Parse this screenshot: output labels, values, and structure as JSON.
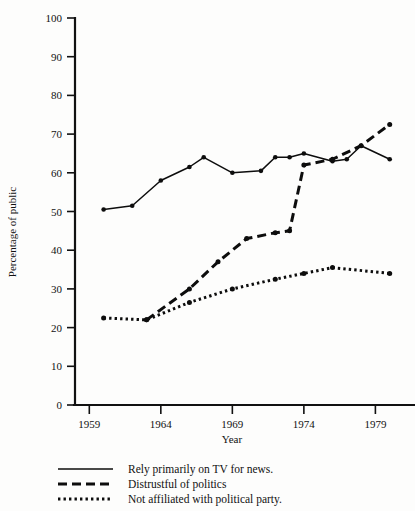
{
  "chart_data": {
    "type": "line",
    "title": "",
    "xlabel": "Year",
    "ylabel": "Percentage of public",
    "xlim": [
      1958,
      1981
    ],
    "ylim": [
      0,
      100
    ],
    "grid": false,
    "legend_position": "below",
    "xticks": [
      1959,
      1964,
      1969,
      1974,
      1979
    ],
    "xtick_labels": [
      "1959",
      "1964",
      "1969",
      "1974",
      "1979"
    ],
    "yticks": [
      0,
      10,
      20,
      30,
      40,
      50,
      60,
      70,
      80,
      90,
      100
    ],
    "ytick_labels": [
      "0",
      "10",
      "20",
      "30",
      "40",
      "50",
      "60",
      "70",
      "80",
      "90",
      "100"
    ],
    "series": [
      {
        "name": "Rely primarily on TV for news.",
        "style": "solid",
        "markers": true,
        "x": [
          1960,
          1962,
          1964,
          1966,
          1967,
          1969,
          1971,
          1972,
          1973,
          1974,
          1976,
          1977,
          1978,
          1980
        ],
        "values": [
          50.5,
          51.5,
          58,
          61.5,
          64,
          60,
          60.5,
          64,
          64,
          65,
          63,
          63.5,
          67,
          63.5
        ]
      },
      {
        "name": "Distrustful of politics",
        "style": "dashed",
        "markers": true,
        "x": [
          1963,
          1966,
          1968,
          1970,
          1972,
          1973,
          1974,
          1976,
          1978,
          1980
        ],
        "values": [
          22,
          30,
          37,
          43,
          44.5,
          45,
          62,
          63.5,
          67,
          72.5
        ]
      },
      {
        "name": "Not affiliated with political party.",
        "style": "dotted",
        "markers": true,
        "x": [
          1960,
          1963,
          1966,
          1969,
          1972,
          1974,
          1976,
          1980
        ],
        "values": [
          22.5,
          22,
          26.5,
          30,
          32.5,
          34,
          35.5,
          34
        ]
      }
    ]
  },
  "legend": {
    "items": [
      {
        "label": "Rely primarily on TV for news.",
        "style": "solid"
      },
      {
        "label": "Distrustful of politics",
        "style": "dashed"
      },
      {
        "label": "Not affiliated with political party.",
        "style": "dotted"
      }
    ]
  }
}
